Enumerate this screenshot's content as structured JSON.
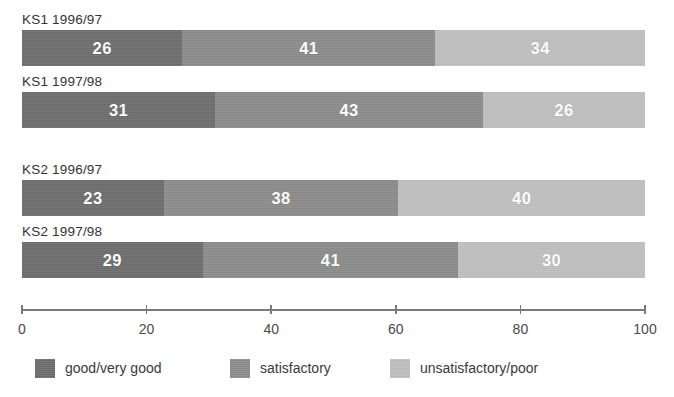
{
  "chart_data": {
    "type": "bar",
    "orientation": "horizontal",
    "stacked": true,
    "title": "",
    "subtitle": "",
    "xlabel": "",
    "ylabel": "",
    "xlim": [
      0,
      100
    ],
    "xticks": [
      0,
      20,
      40,
      60,
      80,
      100
    ],
    "xtick_labels": [
      "0",
      "20",
      "40",
      "60",
      "80",
      "100"
    ],
    "grid": false,
    "legend_position": "bottom-left",
    "categories": [
      "KS1 1996/97",
      "KS1 1997/98",
      "KS2 1996/97",
      "KS2 1997/98"
    ],
    "series": [
      {
        "name": "good/very good",
        "color": "#6e6e6e",
        "values": [
          26,
          31,
          23,
          29
        ]
      },
      {
        "name": "satisfactory",
        "color": "#8c8c8c",
        "values": [
          41,
          43,
          38,
          41
        ]
      },
      {
        "name": "unsatisfactory/poor",
        "color": "#bfbfbf",
        "values": [
          34,
          26,
          40,
          30
        ]
      }
    ]
  },
  "bars": [
    {
      "label": "KS1 1996/97",
      "group": 0,
      "segments": [
        {
          "series": "good/very good",
          "value": 26,
          "display": "26",
          "color": "#6e6e6e"
        },
        {
          "series": "satisfactory",
          "value": 41,
          "display": "41",
          "color": "#8c8c8c"
        },
        {
          "series": "unsatisfactory/poor",
          "value": 34,
          "display": "34",
          "color": "#bfbfbf"
        }
      ]
    },
    {
      "label": "KS1 1997/98",
      "group": 0,
      "segments": [
        {
          "series": "good/very good",
          "value": 31,
          "display": "31",
          "color": "#6e6e6e"
        },
        {
          "series": "satisfactory",
          "value": 43,
          "display": "43",
          "color": "#8c8c8c"
        },
        {
          "series": "unsatisfactory/poor",
          "value": 26,
          "display": "26",
          "color": "#bfbfbf"
        }
      ]
    },
    {
      "label": "KS2 1996/97",
      "group": 1,
      "segments": [
        {
          "series": "good/very good",
          "value": 23,
          "display": "23",
          "color": "#6e6e6e"
        },
        {
          "series": "satisfactory",
          "value": 38,
          "display": "38",
          "color": "#8c8c8c"
        },
        {
          "series": "unsatisfactory/poor",
          "value": 40,
          "display": "40",
          "color": "#bfbfbf"
        }
      ]
    },
    {
      "label": "KS2 1997/98",
      "group": 1,
      "segments": [
        {
          "series": "good/very good",
          "value": 29,
          "display": "29",
          "color": "#6e6e6e"
        },
        {
          "series": "satisfactory",
          "value": 41,
          "display": "41",
          "color": "#8c8c8c"
        },
        {
          "series": "unsatisfactory/poor",
          "value": 30,
          "display": "30",
          "color": "#bfbfbf"
        }
      ]
    }
  ],
  "axis": {
    "ticks": [
      {
        "value": 0,
        "label": "0"
      },
      {
        "value": 20,
        "label": "20"
      },
      {
        "value": 40,
        "label": "40"
      },
      {
        "value": 60,
        "label": "60"
      },
      {
        "value": 80,
        "label": "80"
      },
      {
        "value": 100,
        "label": "100"
      }
    ],
    "line_color": "#7a7a7a"
  },
  "legend": {
    "items": [
      {
        "label": "good/very good",
        "color": "#6e6e6e",
        "offset": 0
      },
      {
        "label": "satisfactory",
        "color": "#8c8c8c",
        "offset": 195
      },
      {
        "label": "unsatisfactory/poor",
        "color": "#bfbfbf",
        "offset": 355
      }
    ]
  }
}
